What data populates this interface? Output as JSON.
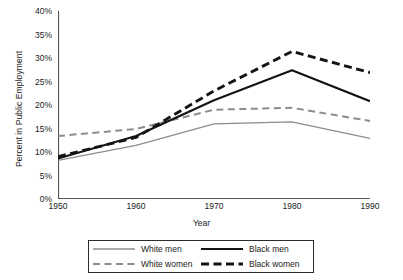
{
  "chart_data": {
    "type": "line",
    "title": "",
    "xlabel": "Year",
    "ylabel": "Percent in Public Employment",
    "x": [
      1950,
      1960,
      1970,
      1980,
      1990
    ],
    "xtick_labels": [
      "1950",
      "1960",
      "1970",
      "1980",
      "1990"
    ],
    "xlim": [
      1950,
      1990
    ],
    "ylim": [
      0,
      40
    ],
    "ytick_values": [
      0,
      5,
      10,
      15,
      20,
      25,
      30,
      35,
      40
    ],
    "ytick_labels": [
      "0%",
      "5%",
      "10%",
      "15%",
      "20%",
      "25%",
      "30%",
      "35%",
      "40%"
    ],
    "grid": false,
    "legend_position": "below-plot",
    "series": [
      {
        "name": "White men",
        "values": [
          8.2,
          11.4,
          16.0,
          16.4,
          12.9
        ],
        "color": "#8c8c8c",
        "style": "solid",
        "width": 1.3
      },
      {
        "name": "White women",
        "values": [
          13.4,
          14.9,
          19.0,
          19.4,
          16.6
        ],
        "color": "#8c8c8c",
        "style": "dashed",
        "width": 2.0
      },
      {
        "name": "Black men",
        "values": [
          8.6,
          13.4,
          21.0,
          27.4,
          20.8
        ],
        "color": "#141414",
        "style": "solid",
        "width": 2.1
      },
      {
        "name": "Black women",
        "values": [
          9.0,
          13.1,
          23.0,
          31.4,
          26.9
        ],
        "color": "#141414",
        "style": "dashed",
        "width": 2.9
      }
    ]
  },
  "legend": {
    "entries": [
      {
        "label": "White men"
      },
      {
        "label": "Black men"
      },
      {
        "label": "White women"
      },
      {
        "label": "Black women"
      }
    ]
  },
  "colors": {
    "axis": "#555555",
    "white_series": "#8c8c8c",
    "black_series": "#141414",
    "background": "#ffffff"
  }
}
